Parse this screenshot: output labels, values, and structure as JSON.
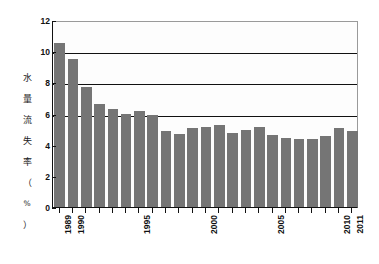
{
  "chart_data": {
    "type": "bar",
    "title": "",
    "subtitle": "",
    "xlabel": "",
    "ylabel": "水量流失率（%）",
    "ylabel_chars": [
      "水",
      "量",
      "流",
      "失",
      "率",
      "（",
      "%",
      "）"
    ],
    "ylim": [
      0,
      12
    ],
    "y_ticks": [
      0,
      2,
      4,
      6,
      8,
      10,
      12
    ],
    "y_tick_labels": [
      "0",
      "2",
      "4",
      "6",
      "8",
      "10",
      "12"
    ],
    "gridlines": [
      6,
      8,
      10,
      12
    ],
    "grid": true,
    "legend": null,
    "legend_position": "none",
    "bar_color": "#757575",
    "axis_color": "#111111",
    "background_color": "#ffffff",
    "categories": [
      "1989",
      "1990",
      "1991",
      "1992",
      "1993",
      "1994",
      "1995",
      "1996",
      "1997",
      "1998",
      "1999",
      "2000",
      "2001",
      "2002",
      "2003",
      "2004",
      "2005",
      "2006",
      "2007",
      "2008",
      "2009",
      "2010",
      "2011"
    ],
    "x_tick_labels_shown": [
      "1989",
      "1990",
      "1995",
      "2000",
      "2005",
      "2010",
      "2011"
    ],
    "values": [
      10.5,
      9.5,
      7.7,
      6.6,
      6.3,
      6.0,
      6.15,
      5.9,
      4.85,
      4.7,
      5.05,
      5.15,
      5.25,
      4.75,
      4.95,
      5.15,
      4.65,
      4.45,
      4.35,
      4.35,
      4.55,
      5.1,
      4.9
    ],
    "series": [
      {
        "name": "水量流失率",
        "values": [
          10.5,
          9.5,
          7.7,
          6.6,
          6.3,
          6.0,
          6.15,
          5.9,
          4.85,
          4.7,
          5.05,
          5.15,
          5.25,
          4.75,
          4.95,
          5.15,
          4.65,
          4.45,
          4.35,
          4.35,
          4.55,
          5.1,
          4.9
        ]
      }
    ]
  }
}
